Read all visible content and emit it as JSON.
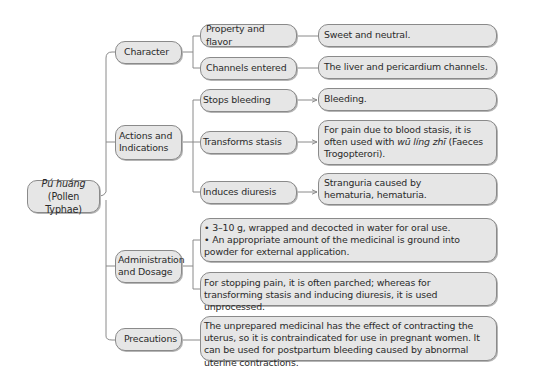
{
  "root": {
    "title_pinyin": "Pú huáng",
    "title_latin": "(Pollen Typhae)"
  },
  "branches": [
    {
      "label": "Character",
      "items": [
        {
          "label": "Property and flavor",
          "value": "Sweet and neutral."
        },
        {
          "label": "Channels entered",
          "value": "The liver and pericardium channels."
        }
      ]
    },
    {
      "label": "Actions and Indications",
      "label_line1": "Actions and",
      "label_line2": "Indications",
      "items": [
        {
          "label": "Stops bleeding",
          "value": "Bleeding."
        },
        {
          "label": "Transforms stasis",
          "value_pre": "For pain due to blood stasis, it is often used with ",
          "value_italic": "wū líng zhī",
          "value_post": " (Faeces Trogopterori)."
        },
        {
          "label": "Induces diuresis",
          "value": "Stranguria caused by hematuria, hematuria."
        }
      ]
    },
    {
      "label": "Administration and Dosage",
      "label_line1": "Administration",
      "label_line2": "and Dosage",
      "items": [
        {
          "bullets": [
            "• 3–10 g, wrapped and decocted in water for oral use.",
            "• An appropriate amount of the medicinal is ground into powder for external application."
          ]
        },
        {
          "value": "For stopping pain, it is often parched; whereas for transforming stasis and inducing diuresis, it is used unprocessed."
        }
      ]
    },
    {
      "label": "Precautions",
      "items": [
        {
          "value": "The unprepared medicinal has the effect of contracting the uterus, so it is contraindicated for use in pregnant women. It can be used for postpartum bleeding caused by abnormal uterine contractions."
        }
      ]
    }
  ],
  "colors": {
    "node_fill": "#e6e6e6",
    "node_border": "#8a8a8a",
    "connector": "#8a8a8a"
  }
}
